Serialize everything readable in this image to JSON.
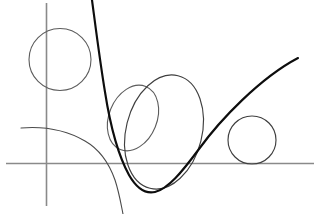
{
  "figure": {
    "width": 317,
    "height": 214,
    "background_color": "#ffffff",
    "style": "line drawing, no labels, no text",
    "colors": {
      "axis": "#8a8a8a",
      "thin_curve": "#4a4a4a",
      "conic": "#3f3f3f",
      "conic_soft": "#5c5c5c",
      "bold_curve": "#0d0d0d"
    }
  },
  "axes": {
    "vertical": {
      "name": "y-axis",
      "x": 46.5,
      "y_top": 3,
      "y_bottom": 206,
      "width": 1.6
    },
    "horizontal": {
      "name": "x-axis",
      "y": 163.5,
      "x_left": 6,
      "x_right": 314,
      "width": 1.6
    },
    "origin": {
      "x": 46.5,
      "y": 163.5
    }
  },
  "shapes": [
    {
      "id": "circle-top-left",
      "name": "circle-top-left",
      "type": "circle",
      "cx": 60,
      "cy": 59.5,
      "r": 31,
      "stroke": "#5c5c5c",
      "stroke_width": 1.1,
      "note": "crossed by the y-axis on its left side and by the bold curve on its right side"
    },
    {
      "id": "circle-right",
      "name": "circle-right-tangent",
      "type": "circle",
      "cx": 252,
      "cy": 140,
      "r": 24,
      "stroke": "#3f3f3f",
      "stroke_width": 1.15,
      "note": "tangent to the x-axis from above and tangent to the rising branch of the bold curve"
    },
    {
      "id": "ellipse-small",
      "name": "ellipse-small-tilted",
      "type": "ellipse",
      "cx": 133,
      "cy": 118,
      "rx": 24,
      "ry": 34,
      "rotation_deg": 22,
      "stroke": "#5c5c5c",
      "stroke_width": 1.1
    },
    {
      "id": "ellipse-large",
      "name": "ellipse-large-tilted",
      "type": "ellipse",
      "cx": 164,
      "cy": 132,
      "rx": 38,
      "ry": 58,
      "rotation_deg": 14,
      "stroke": "#3f3f3f",
      "stroke_width": 1.15
    }
  ],
  "curves": [
    {
      "id": "curve-parabola",
      "name": "bold-parabola-curve",
      "type": "parabola",
      "emphasis": "bold",
      "stroke": "#0d0d0d",
      "stroke_width": 2.15,
      "description": "steep descending branch from top edge, vertex near bottom centre, straight rising branch to upper right corner",
      "vertex": {
        "x": 151,
        "y": 193
      },
      "enters_at": {
        "x": 92,
        "y": 0
      },
      "exits_at": {
        "x": 298,
        "y": 58
      },
      "x_axis_crossings": [
        {
          "x": 114,
          "y": 163.5
        },
        {
          "x": 203,
          "y": 163.5
        }
      ]
    },
    {
      "id": "curve-decay",
      "name": "thin-decaying-curve",
      "type": "decay",
      "emphasis": "thin",
      "stroke": "#4a4a4a",
      "stroke_width": 1.1,
      "description": "gentle curve entering from the left edge, flattening near the top then bending steeply down past the x-axis to the bottom edge",
      "enters_at": {
        "x": 21,
        "y": 128
      },
      "exits_at": {
        "x": 123,
        "y": 214
      },
      "x_axis_crossing": {
        "x": 107,
        "y": 163.5
      }
    }
  ]
}
